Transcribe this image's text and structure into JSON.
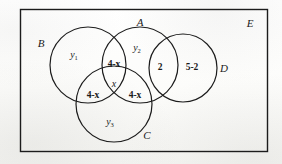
{
  "diagram": {
    "type": "venn-diagram",
    "stroke_color": "#1c1c1c",
    "text_color": "#1a1a1a",
    "background_color": "#fdfdfb",
    "universe": {
      "name": "universe-rectangle",
      "label": "E"
    },
    "sets": [
      {
        "id": "A",
        "label": "A",
        "label_position": "top-center"
      },
      {
        "id": "B",
        "label": "B",
        "label_position": "left"
      },
      {
        "id": "C",
        "label": "C",
        "label_position": "bottom-right"
      },
      {
        "id": "D",
        "label": "D",
        "label_position": "right"
      },
      {
        "id": "E",
        "label": "E",
        "label_position": "top-right-corner"
      }
    ],
    "region_labels": [
      {
        "id": "b-only",
        "text": "y",
        "subscript": "1",
        "region": "B only"
      },
      {
        "id": "a-only",
        "text": "y",
        "subscript": "2",
        "region": "A only"
      },
      {
        "id": "c-only",
        "text": "y",
        "subscript": "3",
        "region": "C only"
      },
      {
        "id": "a-inter-b",
        "text": "4-x",
        "subscript": "",
        "region": "A and B, not C"
      },
      {
        "id": "a-inter-b-inter-c",
        "text": "x",
        "subscript": "",
        "region": "A and B and C"
      },
      {
        "id": "b-inter-c",
        "text": "4-x",
        "subscript": "",
        "region": "B and C, not A"
      },
      {
        "id": "a-inter-c",
        "text": "4-x",
        "subscript": "",
        "region": "A and C, not B"
      },
      {
        "id": "a-inter-d",
        "text": "2",
        "subscript": "",
        "region": "A and D"
      },
      {
        "id": "d-only",
        "text": "5-2",
        "subscript": "",
        "region": "D only"
      }
    ]
  }
}
